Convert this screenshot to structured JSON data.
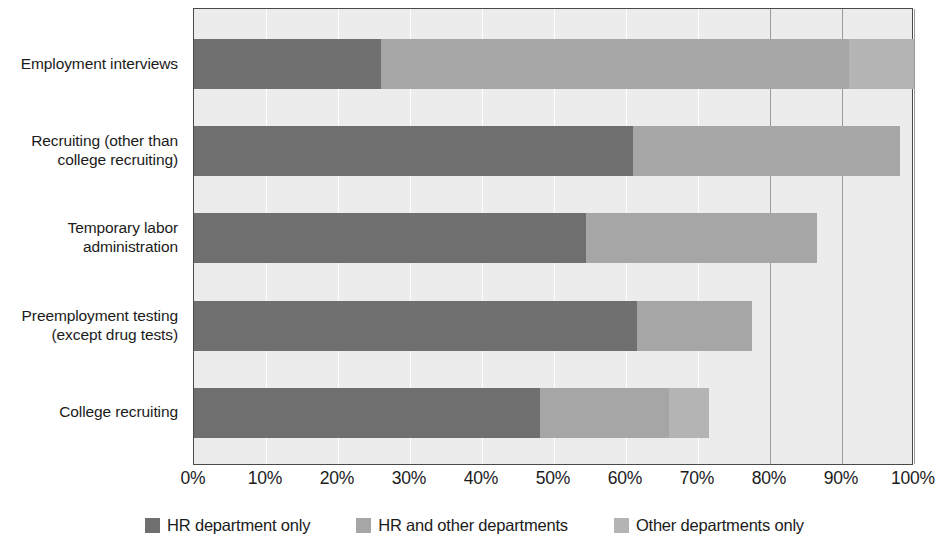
{
  "chart_data": {
    "type": "bar",
    "orientation": "horizontal",
    "stacked": true,
    "title": "",
    "xlabel": "",
    "ylabel": "",
    "xlim": [
      0,
      100
    ],
    "grid": true,
    "legend_position": "bottom",
    "categories": [
      "Employment interviews",
      "Recruiting (other than college recruiting)",
      "Temporary labor administration",
      "Preemployment testing (except drug tests)",
      "College recruiting"
    ],
    "category_lines": [
      [
        "Employment interviews"
      ],
      [
        "Recruiting (other than",
        "college recruiting)"
      ],
      [
        "Temporary labor",
        "administration"
      ],
      [
        "Preemployment testing",
        "(except drug tests)"
      ],
      [
        "College recruiting"
      ]
    ],
    "series": [
      {
        "name": "HR department only",
        "color": "#6f6f6f",
        "values": [
          26,
          61,
          54.5,
          61.5,
          48
        ]
      },
      {
        "name": "HR and other departments",
        "color": "#a6a6a6",
        "values": [
          65,
          37,
          32,
          16,
          18
        ]
      },
      {
        "name": "Other departments only",
        "color": "#b4b4b4",
        "values": [
          9,
          0,
          0,
          0,
          5.5
        ]
      }
    ],
    "totals": [
      100,
      98,
      86.5,
      77.5,
      71.5
    ],
    "tick_labels": [
      "0%",
      "10%",
      "20%",
      "30%",
      "40%",
      "50%",
      "60%",
      "70%",
      "80%",
      "90%",
      "100%"
    ],
    "tick_values": [
      0,
      10,
      20,
      30,
      40,
      50,
      60,
      70,
      80,
      90,
      100
    ],
    "major_gridlines": [
      80,
      90,
      100
    ],
    "legend": [
      {
        "label": "HR department only",
        "color": "#6f6f6f"
      },
      {
        "label": "HR and other departments",
        "color": "#a6a6a6"
      },
      {
        "label": "Other departments only",
        "color": "#b4b4b4"
      }
    ],
    "plot_background": "#ececec",
    "plot_border": "#4a4a4a"
  }
}
